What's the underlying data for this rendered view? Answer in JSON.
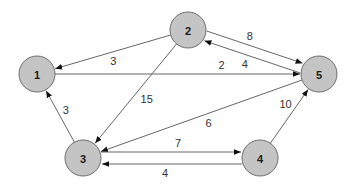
{
  "diagram": {
    "type": "weighted-directed-graph",
    "colors": {
      "node_fill": "#c4c4c4",
      "node_stroke": "#6e6e6e",
      "edge": "#555555",
      "text": "#1a1a1a"
    },
    "nodes": [
      {
        "id": "1",
        "label": "1"
      },
      {
        "id": "2",
        "label": "2"
      },
      {
        "id": "3",
        "label": "3"
      },
      {
        "id": "4",
        "label": "4"
      },
      {
        "id": "5",
        "label": "5"
      }
    ],
    "edges": [
      {
        "from": "2",
        "to": "1",
        "weight": "3"
      },
      {
        "from": "1",
        "to": "5",
        "weight": "2"
      },
      {
        "from": "2",
        "to": "5",
        "weight": "8"
      },
      {
        "from": "5",
        "to": "2",
        "weight": "4"
      },
      {
        "from": "2",
        "to": "3",
        "weight": "15"
      },
      {
        "from": "5",
        "to": "3",
        "weight": "6"
      },
      {
        "from": "3",
        "to": "1",
        "weight": "3"
      },
      {
        "from": "3",
        "to": "4",
        "weight": "7"
      },
      {
        "from": "4",
        "to": "3",
        "weight": "4"
      },
      {
        "from": "4",
        "to": "5",
        "weight": "10"
      }
    ]
  }
}
